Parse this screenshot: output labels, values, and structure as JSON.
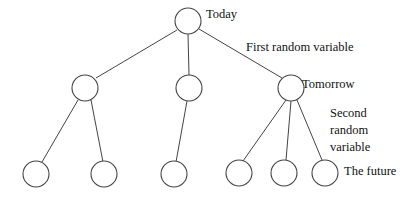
{
  "diagram": {
    "type": "scenario-tree",
    "labels": {
      "today": "Today",
      "first_rv": "First random variable",
      "tomorrow": "Tomorrow",
      "second_rv_1": "Second",
      "second_rv_2": "random",
      "second_rv_3": "variable",
      "future": "The future"
    },
    "levels": [
      {
        "name": "Today",
        "nodes": 1
      },
      {
        "name": "Tomorrow",
        "nodes": 3
      },
      {
        "name": "The future",
        "nodes": 6
      }
    ],
    "branching": {
      "root": 3,
      "tomorrow": [
        2,
        1,
        3
      ]
    }
  }
}
